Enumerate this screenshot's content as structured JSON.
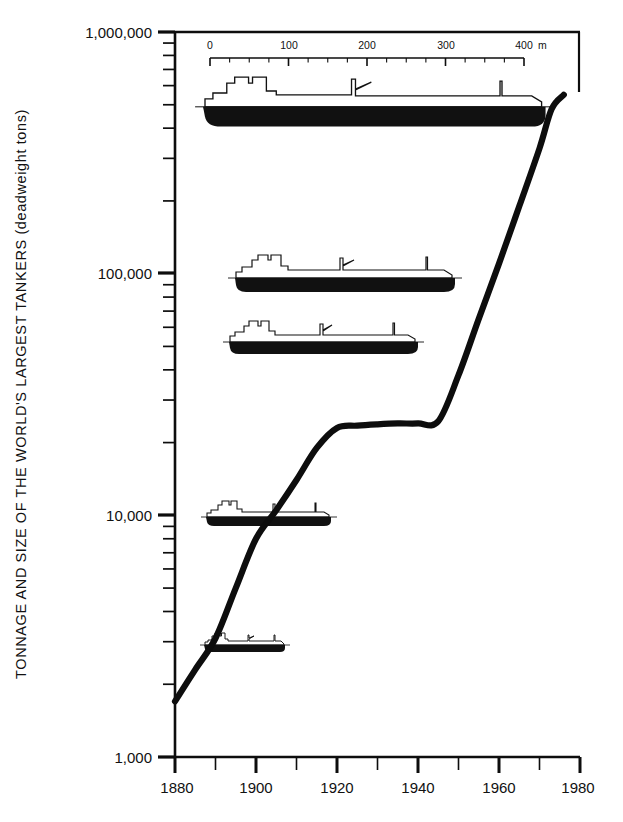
{
  "chart_data": {
    "type": "line",
    "title": "",
    "ylabel": "TONNAGE AND SIZE OF THE WORLD'S LARGEST TANKERS  (deadweight tons)",
    "xlabel": "",
    "yscale": "log",
    "ylim": [
      1000,
      1000000
    ],
    "xlim": [
      1880,
      1980
    ],
    "ytick_labels": [
      "1,000,000",
      "100,000",
      "10,000",
      "1,000"
    ],
    "ytick_values": [
      1000000,
      100000,
      10000,
      1000
    ],
    "xtick_labels": [
      "1880",
      "1900",
      "1920",
      "1940",
      "1960",
      "1980"
    ],
    "xtick_values": [
      1880,
      1900,
      1920,
      1940,
      1960,
      1980
    ],
    "xminor_values": [
      1890,
      1910,
      1930,
      1950,
      1970
    ],
    "grid": false,
    "legend": "none",
    "series": [
      {
        "name": "Largest tanker tonnage",
        "x": [
          1880,
          1885,
          1890,
          1895,
          1900,
          1905,
          1910,
          1915,
          1920,
          1925,
          1930,
          1935,
          1940,
          1945,
          1950,
          1955,
          1960,
          1965,
          1970,
          1973,
          1976
        ],
        "y": [
          1700,
          2300,
          3100,
          5000,
          8000,
          10500,
          14000,
          19000,
          23000,
          23500,
          23800,
          24000,
          24000,
          24500,
          38000,
          65000,
          110000,
          190000,
          330000,
          480000,
          550000
        ]
      }
    ],
    "scalebar": {
      "unit": "m",
      "min": 0,
      "max": 400,
      "major_ticks": [
        0,
        100,
        200,
        300,
        400
      ],
      "major_labels": [
        "0",
        "100",
        "200",
        "300",
        "400"
      ],
      "minor_step": 25,
      "unit_label": "m"
    },
    "ship_silhouettes": [
      {
        "name": "tanker-1976",
        "tonnage": 500000,
        "length_m": 380,
        "y_value": 500000
      },
      {
        "name": "tanker-100k",
        "tonnage": 100000,
        "length_m": 250,
        "y_value": 100000
      },
      {
        "name": "tanker-50k",
        "tonnage": 50000,
        "length_m": 215,
        "y_value": 50000
      },
      {
        "name": "tanker-10k",
        "tonnage": 10000,
        "length_m": 148,
        "y_value": 10000
      },
      {
        "name": "tanker-3k",
        "tonnage": 3000,
        "length_m": 95,
        "y_value": 3000
      }
    ]
  },
  "axis": {
    "y_title": "TONNAGE AND SIZE OF THE WORLD'S LARGEST TANKERS  (deadweight tons)",
    "y_labels": {
      "t1m": "1,000,000",
      "t100k": "100,000",
      "t10k": "10,000",
      "t1k": "1,000"
    },
    "x_labels": {
      "y1880": "1880",
      "y1900": "1900",
      "y1920": "1920",
      "y1940": "1940",
      "y1960": "1960",
      "y1980": "1980"
    }
  },
  "scalebar": {
    "t0": "0",
    "t100": "100",
    "t200": "200",
    "t300": "300",
    "t400": "400",
    "unit": "m"
  },
  "colors": {
    "ink": "#0d0d0d",
    "paper": "#ffffff",
    "hull": "#111111"
  }
}
